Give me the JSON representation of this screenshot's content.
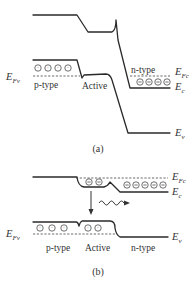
{
  "figure": {
    "panels": [
      {
        "id": "a",
        "caption": "(a)",
        "region_labels": {
          "p": "p-type",
          "active": "Active",
          "n": "n-type"
        },
        "level_labels": {
          "EFv": {
            "main": "E",
            "sub": "Fv"
          },
          "EFc": {
            "main": "E",
            "sub": "Fc"
          },
          "Ec": {
            "main": "E",
            "sub": "c"
          },
          "Ev": {
            "main": "E",
            "sub": "v"
          }
        },
        "p_holes": 4,
        "n_electrons": 4
      },
      {
        "id": "b",
        "caption": "(b)",
        "region_labels": {
          "p": "p-type",
          "active": "Active",
          "n": "n-type"
        },
        "level_labels": {
          "EFv": {
            "main": "E",
            "sub": "Fv"
          },
          "EFc": {
            "main": "E",
            "sub": "Fc"
          },
          "Ec": {
            "main": "E",
            "sub": "c"
          },
          "Ev": {
            "main": "E",
            "sub": "v"
          }
        },
        "active_electrons": 2,
        "n_electrons": 5,
        "p_holes": 3,
        "active_holes": 2,
        "annotations": [
          "recombination-arrow",
          "photon-emission-wave"
        ]
      }
    ],
    "symbols": {
      "hole": "⊙",
      "electron": "⊖"
    },
    "colors": {
      "line": "#2a2a2a",
      "background": "#ffffff"
    }
  }
}
